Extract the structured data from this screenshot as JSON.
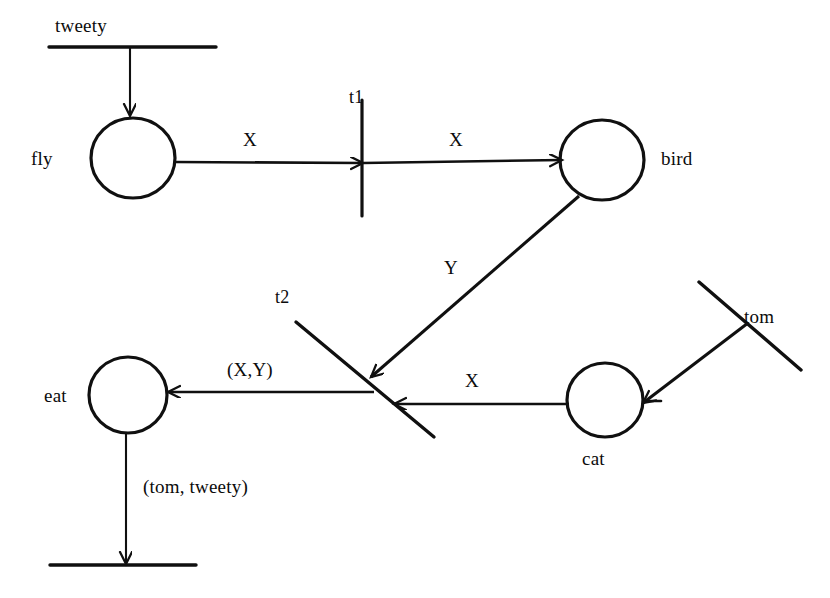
{
  "diagram": {
    "type": "term-unification-graph",
    "stroke_color": "#101010",
    "background_color": "#ffffff",
    "nodes": [
      {
        "id": "tweety-bar",
        "kind": "constant-bar",
        "label": "tweety",
        "orientation": "horizontal",
        "x1": 49,
        "y1": 47,
        "x2": 216,
        "y2": 47,
        "label_x": 55,
        "label_y": 16
      },
      {
        "id": "fly",
        "kind": "circle",
        "label": "fly",
        "cx": 133,
        "cy": 158,
        "r": 41,
        "label_x": 31,
        "label_y": 149
      },
      {
        "id": "t1",
        "kind": "transition-bar",
        "label": "t1",
        "orientation": "vertical",
        "x1": 362,
        "y1": 100,
        "x2": 362,
        "y2": 216,
        "label_x": 349,
        "label_y": 88
      },
      {
        "id": "bird",
        "kind": "circle",
        "label": "bird",
        "cx": 602,
        "cy": 160,
        "r": 41,
        "label_x": 661,
        "label_y": 149
      },
      {
        "id": "t2",
        "kind": "transition-bar",
        "label": "t2",
        "orientation": "diagonal",
        "x1": 296,
        "y1": 322,
        "x2": 434,
        "y2": 437,
        "label_x": 275,
        "label_y": 288
      },
      {
        "id": "eat",
        "kind": "circle",
        "label": "eat",
        "cx": 128,
        "cy": 395,
        "r": 38,
        "label_x": 44,
        "label_y": 386
      },
      {
        "id": "cat",
        "kind": "circle",
        "label": "cat",
        "cx": 605,
        "cy": 400,
        "r": 37,
        "label_x": 582,
        "label_y": 449
      },
      {
        "id": "tom-bar",
        "kind": "constant-bar",
        "label": "tom",
        "orientation": "diagonal",
        "x1": 699,
        "y1": 282,
        "x2": 801,
        "y2": 370,
        "label_x": 744,
        "label_y": 307
      },
      {
        "id": "bottom-bar",
        "kind": "constant-bar",
        "label": "",
        "orientation": "horizontal",
        "x1": 50,
        "y1": 565,
        "x2": 196,
        "y2": 565,
        "label_x": 0,
        "label_y": 0
      }
    ],
    "edges": [
      {
        "id": "edge-tweety-fly",
        "from": "tweety-bar",
        "to": "fly",
        "label": "",
        "arrow": "to",
        "x1": 130,
        "y1": 47,
        "x2": 130,
        "y2": 117
      },
      {
        "id": "edge-fly-t1",
        "from": "fly",
        "to": "t1",
        "label": "X",
        "arrow": "to",
        "x1": 174,
        "y1": 162,
        "x2": 362,
        "y2": 163,
        "label_x": 242,
        "label_y": 130
      },
      {
        "id": "edge-t1-bird",
        "from": "t1",
        "to": "bird",
        "label": "X",
        "arrow": "to",
        "x1": 362,
        "y1": 163,
        "x2": 561,
        "y2": 160,
        "label_x": 447,
        "label_y": 130
      },
      {
        "id": "edge-bird-t2",
        "from": "bird",
        "to": "t2",
        "label": "Y",
        "arrow": "to",
        "x1": 578,
        "y1": 196,
        "x2": 369,
        "y2": 378,
        "label_x": 443,
        "label_y": 258
      },
      {
        "id": "edge-t2-eat",
        "from": "t2",
        "to": "eat",
        "label": "(X,Y)",
        "arrow": "to",
        "x1": 372,
        "y1": 392,
        "x2": 166,
        "y2": 392,
        "label_x": 227,
        "label_y": 360
      },
      {
        "id": "edge-cat-t2",
        "from": "cat",
        "to": "t2",
        "label": "X",
        "arrow": "to",
        "x1": 568,
        "y1": 404,
        "x2": 392,
        "y2": 404,
        "label_x": 464,
        "label_y": 371
      },
      {
        "id": "edge-tom-cat",
        "from": "tom-bar",
        "to": "cat",
        "label": "",
        "arrow": "to",
        "x1": 746,
        "y1": 324,
        "x2": 641,
        "y2": 404
      },
      {
        "id": "edge-eat-bottom",
        "from": "eat",
        "to": "bottom-bar",
        "label": "(tom, tweety)",
        "arrow": "to",
        "x1": 126,
        "y1": 433,
        "x2": 126,
        "y2": 563,
        "label_x": 143,
        "label_y": 477
      }
    ],
    "labels": {
      "tweety": "tweety",
      "fly": "fly",
      "t1": "t1",
      "bird": "bird",
      "t2": "t2",
      "eat": "eat",
      "cat": "cat",
      "tom": "tom",
      "x_left": "X",
      "x_right": "X",
      "y": "Y",
      "x_cat": "X",
      "xy_pair": "(X,Y)",
      "tom_tweety_pair": "(tom, tweety)"
    }
  }
}
